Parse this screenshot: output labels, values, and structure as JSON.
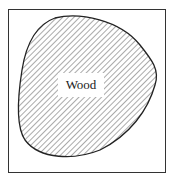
{
  "diagram": {
    "type": "cross-section",
    "region_label": "Wood",
    "fill_pattern": "diagonal-hatch",
    "colors": {
      "stroke": "#222222",
      "hatch": "#555555",
      "background": "#ffffff",
      "label_box": "#ffffff"
    }
  }
}
